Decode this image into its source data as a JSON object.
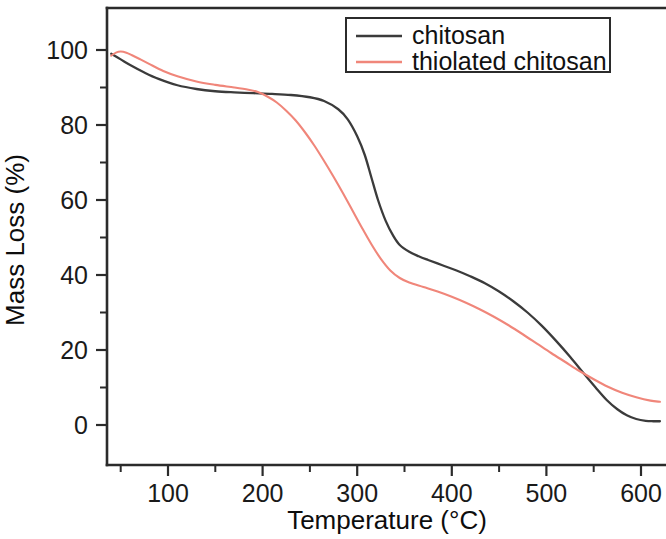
{
  "chart_data": {
    "type": "line",
    "title": "",
    "subtitle": "",
    "xlabel": "Temperature (°C)",
    "ylabel": "Mass Loss (%)",
    "xlim": [
      37,
      625
    ],
    "ylim": [
      -4,
      104
    ],
    "grid": false,
    "legend_position": "top-right",
    "x_ticks_major": [
      100,
      200,
      300,
      400,
      500,
      600
    ],
    "x_tick_labels": [
      "100",
      "200",
      "300",
      "400",
      "500",
      "600"
    ],
    "x_ticks_minor": [
      50,
      150,
      250,
      350,
      450,
      550
    ],
    "y_ticks_major": [
      0,
      20,
      40,
      60,
      80,
      100
    ],
    "y_tick_labels": [
      "0",
      "20",
      "40",
      "60",
      "80",
      "100"
    ],
    "y_ticks_minor": [
      10,
      30,
      50,
      70,
      90
    ],
    "series": [
      {
        "name": "chitosan",
        "color": "#3b3b3b",
        "width": 2.3,
        "x": [
          40,
          50,
          60,
          75,
          90,
          110,
          130,
          150,
          170,
          190,
          210,
          230,
          250,
          265,
          280,
          290,
          300,
          308,
          315,
          322,
          330,
          338,
          345,
          355,
          365,
          375,
          390,
          405,
          420,
          435,
          450,
          465,
          480,
          495,
          510,
          525,
          540,
          552,
          564,
          575,
          585,
          595,
          605,
          613,
          620
        ],
        "y": [
          99.0,
          97.5,
          96.0,
          94.0,
          92.3,
          90.6,
          89.6,
          89.0,
          88.7,
          88.5,
          88.3,
          88.0,
          87.4,
          86.4,
          84.2,
          81.5,
          77.0,
          72.0,
          66.0,
          60.0,
          54.5,
          50.5,
          48.0,
          46.2,
          45.0,
          44.0,
          42.6,
          41.2,
          39.6,
          37.8,
          35.6,
          33.0,
          30.0,
          26.5,
          22.5,
          18.2,
          13.6,
          10.0,
          6.6,
          4.2,
          2.6,
          1.6,
          1.1,
          1.0,
          1.0
        ]
      },
      {
        "name": "thiolated chitosan",
        "color": "#f0867a",
        "width": 2.1,
        "x": [
          40,
          45,
          50,
          56,
          62,
          70,
          80,
          95,
          110,
          130,
          150,
          170,
          185,
          195,
          205,
          215,
          225,
          235,
          245,
          255,
          265,
          275,
          285,
          295,
          305,
          315,
          325,
          335,
          345,
          355,
          370,
          385,
          400,
          415,
          430,
          445,
          460,
          475,
          490,
          505,
          520,
          535,
          550,
          565,
          580,
          595,
          610,
          620
        ],
        "y": [
          98.5,
          99.3,
          99.6,
          99.3,
          98.6,
          97.6,
          96.3,
          94.4,
          93.0,
          91.6,
          90.7,
          90.0,
          89.4,
          88.8,
          87.6,
          86.0,
          83.8,
          81.2,
          78.0,
          74.4,
          70.4,
          66.2,
          61.8,
          57.2,
          52.6,
          48.2,
          44.3,
          41.2,
          39.2,
          38.0,
          36.8,
          35.6,
          34.2,
          32.6,
          30.8,
          28.8,
          26.6,
          24.2,
          21.7,
          19.2,
          16.8,
          14.4,
          12.2,
          10.2,
          8.6,
          7.4,
          6.5,
          6.2
        ]
      }
    ]
  },
  "legend": {
    "entries": [
      {
        "label": "chitosan",
        "color": "#3b3b3b"
      },
      {
        "label": "thiolated chitosan",
        "color": "#f0867a"
      }
    ]
  },
  "axes": {
    "x_title": "Temperature (°C)",
    "y_title": "Mass Loss (%)"
  }
}
